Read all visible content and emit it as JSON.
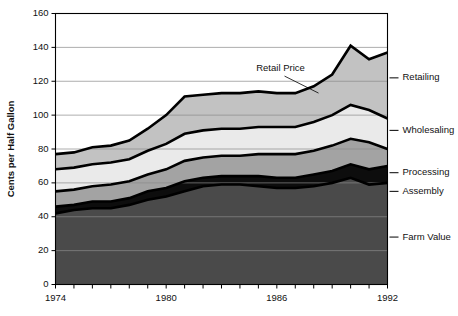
{
  "chart_data": {
    "type": "area",
    "title": "",
    "xlabel": "",
    "ylabel": "Cents per Half Gallon",
    "xlim": [
      1974,
      1992
    ],
    "ylim": [
      0,
      160
    ],
    "ytick_step": 20,
    "yticks": [
      0,
      20,
      40,
      60,
      80,
      100,
      120,
      140,
      160
    ],
    "ytick_labels": [
      "0",
      "20",
      "40",
      "60",
      "80",
      "100",
      "120",
      "140",
      "160"
    ],
    "xticks": [
      1974,
      1975,
      1976,
      1977,
      1978,
      1979,
      1980,
      1981,
      1982,
      1983,
      1984,
      1985,
      1986,
      1987,
      1988,
      1989,
      1990,
      1991,
      1992
    ],
    "xtick_labels_shown": [
      "1974",
      "1980",
      "1986",
      "1992"
    ],
    "xtick_labels_shown_at": [
      1974,
      1980,
      1986,
      1992
    ],
    "grid": "horizontal",
    "grid_values": [
      20,
      40,
      60,
      80,
      100,
      120,
      140
    ],
    "legend_position": "right-inline-labels",
    "stacked": true,
    "stack_order_bottom_to_top": [
      "Farm Value",
      "Assembly",
      "Processing",
      "Wholesaling",
      "Retailing"
    ],
    "x": [
      1974,
      1975,
      1976,
      1977,
      1978,
      1979,
      1980,
      1981,
      1982,
      1983,
      1984,
      1985,
      1986,
      1987,
      1988,
      1989,
      1990,
      1991,
      1992
    ],
    "series": [
      {
        "name": "Farm Value",
        "color": "#4a4a4a",
        "values": [
          42,
          44,
          45,
          45,
          47,
          50,
          52,
          55,
          58,
          59,
          59,
          58,
          57,
          57,
          58,
          60,
          63,
          59,
          60
        ]
      },
      {
        "name": "Assembly",
        "color": "#0d0d0d",
        "values": [
          4,
          3,
          4,
          4,
          4,
          5,
          5,
          6,
          5,
          5,
          5,
          6,
          6,
          6,
          7,
          7,
          8,
          9,
          10
        ]
      },
      {
        "name": "Processing",
        "color": "#a3a3a3",
        "values": [
          9,
          9,
          9,
          10,
          10,
          10,
          11,
          12,
          12,
          12,
          12,
          13,
          14,
          14,
          14,
          15,
          15,
          16,
          10
        ]
      },
      {
        "name": "Wholesaling",
        "color": "#eaeaea",
        "values": [
          13,
          13,
          13,
          13,
          13,
          14,
          15,
          16,
          16,
          16,
          16,
          16,
          16,
          16,
          17,
          18,
          20,
          19,
          18
        ]
      },
      {
        "name": "Retailing",
        "color": "#c2c2c2",
        "values": [
          9,
          9,
          10,
          10,
          11,
          13,
          17,
          22,
          21,
          21,
          21,
          21,
          20,
          20,
          21,
          24,
          35,
          30,
          39
        ]
      }
    ],
    "cumulative_tops": {
      "Farm Value": [
        42,
        44,
        45,
        45,
        47,
        50,
        52,
        55,
        58,
        59,
        59,
        58,
        57,
        57,
        58,
        60,
        63,
        59,
        60
      ],
      "Assembly": [
        46,
        47,
        49,
        49,
        51,
        55,
        57,
        61,
        63,
        64,
        64,
        64,
        63,
        63,
        65,
        67,
        71,
        68,
        70
      ],
      "Processing": [
        55,
        56,
        58,
        59,
        61,
        65,
        68,
        73,
        75,
        76,
        76,
        77,
        77,
        77,
        79,
        82,
        86,
        84,
        80
      ],
      "Wholesaling": [
        68,
        69,
        71,
        72,
        74,
        79,
        83,
        89,
        91,
        92,
        92,
        93,
        93,
        93,
        96,
        100,
        106,
        103,
        98
      ],
      "Retailing": [
        77,
        78,
        81,
        82,
        85,
        92,
        100,
        111,
        112,
        113,
        113,
        114,
        113,
        113,
        117,
        124,
        141,
        133,
        137
      ]
    },
    "retail_price_line": {
      "label": "Retail Price",
      "values": [
        77,
        78,
        81,
        82,
        85,
        92,
        100,
        111,
        112,
        113,
        113,
        114,
        113,
        113,
        117,
        124,
        141,
        133,
        137
      ]
    },
    "annotations": [
      {
        "text": "Retail Price",
        "x_year": 1986.2,
        "y_value": 126
      }
    ],
    "series_labels_right": [
      {
        "text": "Retailing",
        "y_value": 122
      },
      {
        "text": "Wholesaling",
        "y_value": 91
      },
      {
        "text": "Processing",
        "y_value": 66
      },
      {
        "text": "Assembly",
        "y_value": 55
      },
      {
        "text": "Farm Value",
        "y_value": 28
      }
    ]
  }
}
